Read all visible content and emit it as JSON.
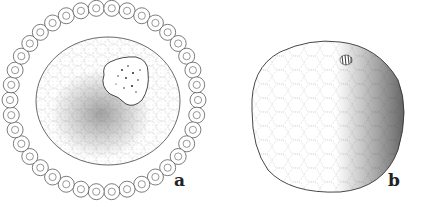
{
  "figure": {
    "panels": [
      {
        "label": "a",
        "description": "oocyte with nucleus surrounded by a ring of follicle cells"
      },
      {
        "label": "b",
        "description": "egg cell with spindle near the surface and dense stippling on right side"
      }
    ]
  },
  "colors": {
    "ink": "#333333",
    "background": "#ffffff"
  }
}
